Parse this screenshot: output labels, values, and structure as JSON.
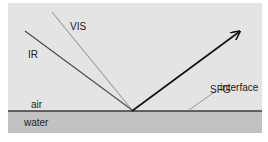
{
  "diagram": {
    "labels": {
      "vis": "VIS",
      "ir": "IR",
      "sfg": "SFG",
      "air": "air",
      "water": "water",
      "interface": "interface"
    },
    "colors": {
      "background": "#ffffff",
      "air": "#e4e4e4",
      "water": "#c2c2c2",
      "interface_line": "#3a3a3a",
      "ir_beam": "#555555",
      "vis_beam": "#9a9a9a",
      "sfg_beam": "#111111",
      "pointer": "#9a9a9a"
    }
  }
}
